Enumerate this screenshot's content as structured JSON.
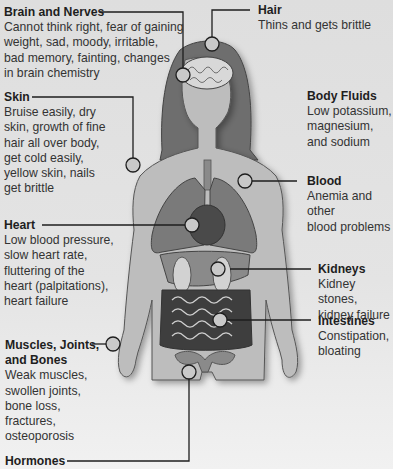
{
  "labels": {
    "brain": {
      "title": "Brain and Nerves",
      "lines": [
        "Cannot think right, fear of gaining",
        "weight, sad, moody, irritable,",
        "bad memory, fainting, changes",
        "in brain chemistry"
      ]
    },
    "hair": {
      "title": "Hair",
      "lines": [
        "Thins and gets brittle"
      ]
    },
    "skin": {
      "title": "Skin",
      "lines": [
        "Bruise easily, dry",
        "skin, growth of fine",
        "hair all over body,",
        "get cold easily,",
        "yellow skin, nails",
        "get brittle"
      ]
    },
    "fluids": {
      "title": "Body Fluids",
      "lines": [
        "Low potassium,",
        "magnesium,",
        "and sodium"
      ]
    },
    "blood": {
      "title": "Blood",
      "lines": [
        "Anemia and other",
        "blood problems"
      ]
    },
    "heart": {
      "title": "Heart",
      "lines": [
        "Low blood pressure,",
        "slow heart rate,",
        "fluttering of the",
        "heart (palpitations),",
        "heart failure"
      ]
    },
    "kidneys": {
      "title": "Kidneys",
      "lines": [
        "Kidney stones,",
        "kidney failure"
      ]
    },
    "intestines": {
      "title": "Intestines",
      "lines": [
        "Constipation,",
        "bloating"
      ]
    },
    "muscles": {
      "title": "Muscles, Joints,",
      "title2": "and Bones",
      "lines": [
        "Weak muscles,",
        "swollen joints,",
        "bone loss,",
        "fractures,",
        "osteoporosis"
      ]
    },
    "hormones": {
      "title": "Hormones",
      "lines": []
    }
  },
  "colors": {
    "background": "#e4e4e4",
    "body": "#bdbdbd",
    "hair": "#6e6e6e",
    "organs_dark": "#5e5e5e",
    "organs_mid": "#8a8a8a",
    "line": "#1e1e1e"
  }
}
